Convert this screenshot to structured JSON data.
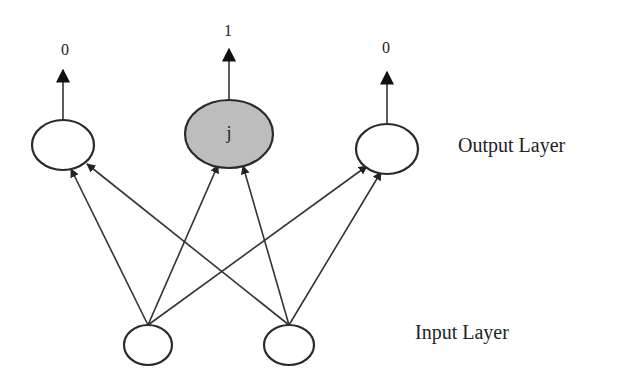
{
  "diagram": {
    "type": "neural-network",
    "layers": {
      "output": {
        "label": "Output Layer",
        "nodes": [
          {
            "id": "out-left",
            "label": "",
            "output_value": "0",
            "highlighted": false
          },
          {
            "id": "out-j",
            "label": "j",
            "output_value": "1",
            "highlighted": true
          },
          {
            "id": "out-right",
            "label": "",
            "output_value": "0",
            "highlighted": false
          }
        ]
      },
      "input": {
        "label": "Input Layer",
        "nodes": [
          {
            "id": "in-left",
            "label": ""
          },
          {
            "id": "in-right",
            "label": ""
          }
        ]
      }
    },
    "edges": [
      {
        "from": "in-left",
        "to": "out-left"
      },
      {
        "from": "in-left",
        "to": "out-j"
      },
      {
        "from": "in-left",
        "to": "out-right"
      },
      {
        "from": "in-right",
        "to": "out-left"
      },
      {
        "from": "in-right",
        "to": "out-j"
      },
      {
        "from": "in-right",
        "to": "out-right"
      }
    ],
    "colors": {
      "highlight_fill": "#bdbdbd",
      "node_fill": "#ffffff",
      "stroke": "#2a2a2a"
    }
  }
}
